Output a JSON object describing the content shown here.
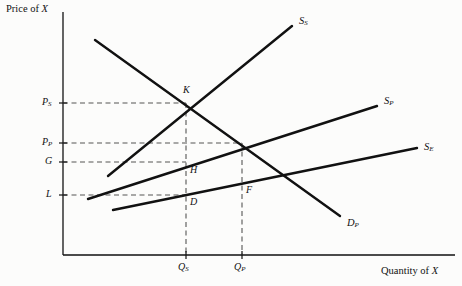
{
  "chart_data": {
    "type": "line",
    "title": "",
    "xlabel": "Quantity of X",
    "ylabel": "Price of X",
    "xlim": [
      0,
      462
    ],
    "ylim": [
      0,
      286
    ],
    "grid": false,
    "legend_position": "inline-curve-end-labels",
    "axes": {
      "origin_x": 63,
      "origin_y": 255,
      "x_end": 455,
      "y_top": 12
    },
    "y_ticks": [
      {
        "label": "P",
        "sub": "S",
        "value": 103
      },
      {
        "label": "P",
        "sub": "P",
        "value": 143
      },
      {
        "label": "G",
        "sub": "",
        "value": 162
      },
      {
        "label": "L",
        "sub": "",
        "value": 195
      }
    ],
    "x_ticks": [
      {
        "label": "Q",
        "sub": "S",
        "value": 186
      },
      {
        "label": "Q",
        "sub": "P",
        "value": 242
      }
    ],
    "series": [
      {
        "name": "S",
        "sub": "S",
        "label_x": 299,
        "label_y": 16,
        "points": [
          [
            108,
            176
          ],
          [
            292,
            26
          ]
        ],
        "description": "upward sloping supply curve S-sub-S"
      },
      {
        "name": "S",
        "sub": "P",
        "label_x": 384,
        "label_y": 96,
        "points": [
          [
            88,
            199
          ],
          [
            377,
            106
          ]
        ],
        "description": "upward sloping supply curve S-sub-P"
      },
      {
        "name": "S",
        "sub": "E",
        "label_x": 424,
        "label_y": 142,
        "points": [
          [
            113,
            210
          ],
          [
            417,
            148
          ]
        ],
        "description": "upward sloping supply curve S-sub-E"
      },
      {
        "name": "D",
        "sub": "P",
        "label_x": 347,
        "label_y": 223,
        "points": [
          [
            95,
            40
          ],
          [
            340,
            216
          ]
        ],
        "description": "downward sloping demand curve D-sub-P"
      }
    ],
    "points": [
      {
        "label": "K",
        "x": 186,
        "y": 104,
        "lx": 183,
        "ly": 89
      },
      {
        "label": "H",
        "x": 186,
        "y": 163,
        "lx": 190,
        "ly": 168
      },
      {
        "label": "D",
        "x": 186,
        "y": 195,
        "lx": 190,
        "ly": 200
      },
      {
        "label": "F",
        "x": 242,
        "y": 183,
        "lx": 246,
        "ly": 188
      }
    ],
    "dashed_guides": [
      {
        "from": [
          63,
          103
        ],
        "to": [
          186,
          103
        ],
        "orient": "horizontal"
      },
      {
        "from": [
          63,
          143
        ],
        "to": [
          242,
          143
        ],
        "orient": "horizontal"
      },
      {
        "from": [
          63,
          162
        ],
        "to": [
          186,
          162
        ],
        "orient": "horizontal"
      },
      {
        "from": [
          63,
          195
        ],
        "to": [
          186,
          195
        ],
        "orient": "horizontal"
      },
      {
        "from": [
          186,
          103
        ],
        "to": [
          186,
          255
        ],
        "orient": "vertical"
      },
      {
        "from": [
          242,
          143
        ],
        "to": [
          242,
          255
        ],
        "orient": "vertical"
      }
    ]
  },
  "labels": {
    "y_axis_title": "Price of X",
    "y_axis_title_prefix": "Price of ",
    "y_axis_title_var": "X",
    "x_axis_title_prefix": "Quantity of ",
    "x_axis_title_var": "X",
    "tick_ps_main": "P",
    "tick_ps_sub": "S",
    "tick_pp_main": "P",
    "tick_pp_sub": "P",
    "tick_g_main": "G",
    "tick_l_main": "L",
    "tick_qs_main": "Q",
    "tick_qs_sub": "S",
    "tick_qp_main": "Q",
    "tick_qp_sub": "P",
    "curve_ss_main": "S",
    "curve_ss_sub": "S",
    "curve_sp_main": "S",
    "curve_sp_sub": "P",
    "curve_se_main": "S",
    "curve_se_sub": "E",
    "curve_dp_main": "D",
    "curve_dp_sub": "P",
    "point_k": "K",
    "point_h": "H",
    "point_d": "D",
    "point_f": "F"
  },
  "colors": {
    "ink": "#111111",
    "background": "#fcfcfb",
    "dash": "#555555"
  }
}
